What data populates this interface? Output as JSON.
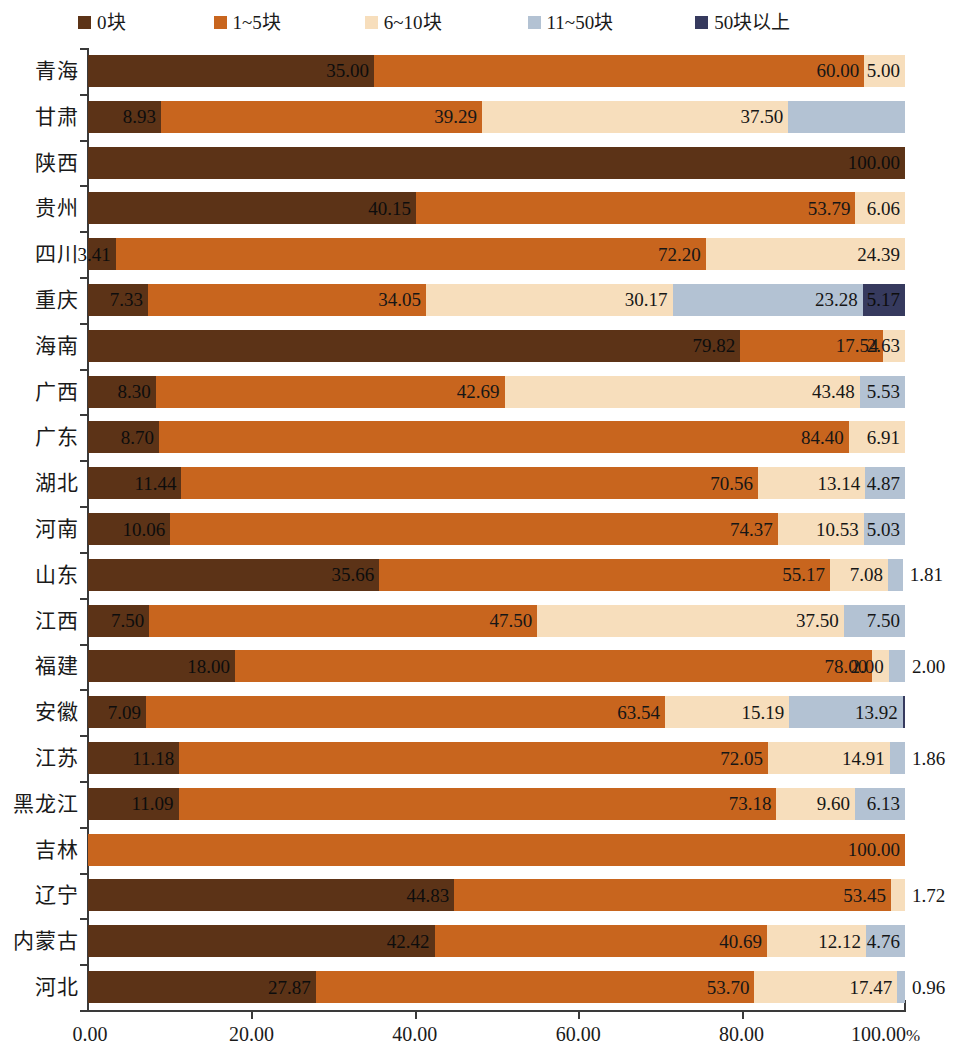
{
  "legend": {
    "items": [
      {
        "label": "0块",
        "color": "#5C3317",
        "name": "legend-0"
      },
      {
        "label": "1~5块",
        "color": "#C8651E",
        "name": "legend-1-5"
      },
      {
        "label": "6~10块",
        "color": "#F7DEBC",
        "name": "legend-6-10"
      },
      {
        "label": "11~50块",
        "color": "#B3C2D3",
        "name": "legend-11-50"
      },
      {
        "label": "50块以上",
        "color": "#363A5E",
        "name": "legend-50-plus"
      }
    ]
  },
  "axis": {
    "ticks": [
      "0.00",
      "20.00",
      "40.00",
      "60.00",
      "80.00",
      "100.00"
    ],
    "unit": "%",
    "min": 0,
    "max": 100
  },
  "chart_data": {
    "type": "bar",
    "orientation": "horizontal",
    "stacked": true,
    "normalized": true,
    "title": "",
    "xlabel": "%",
    "ylabel": "",
    "xlim": [
      0,
      100
    ],
    "xticks": [
      0,
      20,
      40,
      60,
      80,
      100
    ],
    "xticklabels": [
      "0.00",
      "20.00",
      "40.00",
      "60.00",
      "80.00",
      "100.00%"
    ],
    "grid": false,
    "legend_position": "top",
    "series": [
      {
        "name": "0块",
        "color": "#5C3317"
      },
      {
        "name": "1~5块",
        "color": "#C8651E"
      },
      {
        "name": "6~10块",
        "color": "#F7DEBC"
      },
      {
        "name": "11~50块",
        "color": "#B3C2D3"
      },
      {
        "name": "50块以上",
        "color": "#363A5E"
      }
    ],
    "categories": [
      "青海",
      "甘肃",
      "陕西",
      "贵州",
      "四川",
      "重庆",
      "海南",
      "广西",
      "广东",
      "湖北",
      "河南",
      "山东",
      "江西",
      "福建",
      "安徽",
      "江苏",
      "黑龙江",
      "吉林",
      "辽宁",
      "内蒙古",
      "河北"
    ],
    "rows": [
      {
        "category": "青海",
        "values": [
          35.0,
          60.0,
          5.0,
          0,
          0
        ],
        "labels": [
          "35.00",
          "60.00",
          "5.00",
          "",
          ""
        ],
        "label_outside": [
          false,
          false,
          false,
          false,
          false
        ]
      },
      {
        "category": "甘肃",
        "values": [
          8.93,
          39.29,
          37.5,
          14.28,
          0
        ],
        "labels": [
          "8.93",
          "39.29",
          "37.50",
          "",
          ""
        ],
        "label_outside": [
          false,
          false,
          false,
          false,
          false
        ]
      },
      {
        "category": "陕西",
        "values": [
          100.0,
          0,
          0,
          0,
          0
        ],
        "labels": [
          "100.00",
          "",
          "",
          "",
          ""
        ],
        "label_outside": [
          false,
          false,
          false,
          false,
          false
        ]
      },
      {
        "category": "贵州",
        "values": [
          40.15,
          53.79,
          6.06,
          0,
          0
        ],
        "labels": [
          "40.15",
          "53.79",
          "6.06",
          "",
          ""
        ],
        "label_outside": [
          false,
          false,
          false,
          false,
          false
        ]
      },
      {
        "category": "四川",
        "values": [
          3.41,
          72.2,
          24.39,
          0,
          0
        ],
        "labels": [
          "3.41",
          "72.20",
          "24.39",
          "",
          ""
        ],
        "label_outside": [
          false,
          false,
          false,
          false,
          false
        ]
      },
      {
        "category": "重庆",
        "values": [
          7.33,
          34.05,
          30.17,
          23.28,
          5.17
        ],
        "labels": [
          "7.33",
          "34.05",
          "30.17",
          "23.28",
          "5.17"
        ],
        "label_outside": [
          false,
          false,
          false,
          false,
          false
        ]
      },
      {
        "category": "海南",
        "values": [
          79.82,
          17.54,
          2.63,
          0,
          0
        ],
        "labels": [
          "79.82",
          "17.54",
          "2.63",
          "",
          ""
        ],
        "label_outside": [
          false,
          false,
          false,
          false,
          false
        ]
      },
      {
        "category": "广西",
        "values": [
          8.3,
          42.69,
          43.48,
          5.53,
          0
        ],
        "labels": [
          "8.30",
          "42.69",
          "43.48",
          "5.53",
          ""
        ],
        "label_outside": [
          false,
          false,
          false,
          false,
          false
        ]
      },
      {
        "category": "广东",
        "values": [
          8.7,
          84.4,
          6.91,
          0,
          0
        ],
        "labels": [
          "8.70",
          "84.40",
          "6.91",
          "",
          ""
        ],
        "label_outside": [
          false,
          false,
          false,
          false,
          false
        ]
      },
      {
        "category": "湖北",
        "values": [
          11.44,
          70.56,
          13.14,
          4.87,
          0
        ],
        "labels": [
          "11.44",
          "70.56",
          "13.14",
          "4.87",
          ""
        ],
        "label_outside": [
          false,
          false,
          false,
          false,
          false
        ]
      },
      {
        "category": "河南",
        "values": [
          10.06,
          74.37,
          10.53,
          5.03,
          0
        ],
        "labels": [
          "10.06",
          "74.37",
          "10.53",
          "5.03",
          ""
        ],
        "label_outside": [
          false,
          false,
          false,
          false,
          false
        ]
      },
      {
        "category": "山东",
        "values": [
          35.66,
          55.17,
          7.08,
          1.81,
          0
        ],
        "labels": [
          "35.66",
          "55.17",
          "7.08",
          "1.81",
          ""
        ],
        "label_outside": [
          false,
          false,
          false,
          true,
          false
        ]
      },
      {
        "category": "江西",
        "values": [
          7.5,
          47.5,
          37.5,
          7.5,
          0
        ],
        "labels": [
          "7.50",
          "47.50",
          "37.50",
          "7.50",
          ""
        ],
        "label_outside": [
          false,
          false,
          false,
          false,
          false
        ]
      },
      {
        "category": "福建",
        "values": [
          18.0,
          78.0,
          2.0,
          2.0,
          0
        ],
        "labels": [
          "18.00",
          "78.00",
          "2.00",
          "2.00",
          ""
        ],
        "label_outside": [
          false,
          false,
          false,
          true,
          false
        ]
      },
      {
        "category": "安徽",
        "values": [
          7.09,
          63.54,
          15.19,
          13.92,
          0.26
        ],
        "labels": [
          "7.09",
          "63.54",
          "15.19",
          "13.92",
          ""
        ],
        "label_outside": [
          false,
          false,
          false,
          false,
          false
        ]
      },
      {
        "category": "江苏",
        "values": [
          11.18,
          72.05,
          14.91,
          1.86,
          0
        ],
        "labels": [
          "11.18",
          "72.05",
          "14.91",
          "1.86",
          ""
        ],
        "label_outside": [
          false,
          false,
          false,
          true,
          false
        ]
      },
      {
        "category": "黑龙江",
        "values": [
          11.09,
          73.18,
          9.6,
          6.13,
          0
        ],
        "labels": [
          "11.09",
          "73.18",
          "9.60",
          "6.13",
          ""
        ],
        "label_outside": [
          false,
          false,
          false,
          false,
          false
        ]
      },
      {
        "category": "吉林",
        "values": [
          0,
          100.0,
          0,
          0,
          0
        ],
        "labels": [
          "",
          "100.00",
          "",
          "",
          ""
        ],
        "label_outside": [
          false,
          false,
          false,
          false,
          false
        ]
      },
      {
        "category": "辽宁",
        "values": [
          44.83,
          53.45,
          1.72,
          0,
          0
        ],
        "labels": [
          "44.83",
          "53.45",
          "1.72",
          "",
          ""
        ],
        "label_outside": [
          false,
          false,
          true,
          false,
          false
        ]
      },
      {
        "category": "内蒙古",
        "values": [
          42.42,
          40.69,
          12.12,
          4.76,
          0
        ],
        "labels": [
          "42.42",
          "40.69",
          "12.12",
          "4.76",
          ""
        ],
        "label_outside": [
          false,
          false,
          false,
          false,
          false
        ]
      },
      {
        "category": "河北",
        "values": [
          27.87,
          53.7,
          17.47,
          0.96,
          0
        ],
        "labels": [
          "27.87",
          "53.70",
          "17.47",
          "0.96",
          ""
        ],
        "label_outside": [
          false,
          false,
          false,
          true,
          false
        ]
      }
    ]
  }
}
